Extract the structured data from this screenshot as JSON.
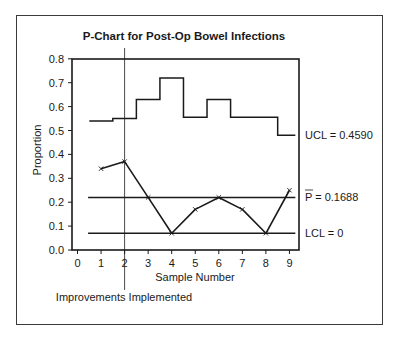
{
  "chart_data": {
    "type": "line",
    "title": "P-Chart for Post-Op Bowel Infections",
    "xlabel": "Sample Number",
    "ylabel": "Proportion",
    "xlim": [
      0,
      9.5
    ],
    "ylim": [
      0.0,
      0.8
    ],
    "x_ticks": [
      "0",
      "1",
      "2",
      "3",
      "4",
      "5",
      "6",
      "7",
      "8",
      "9"
    ],
    "y_ticks": [
      "0.0",
      "0.1",
      "0.2",
      "0.3",
      "0.4",
      "0.5",
      "0.6",
      "0.7",
      "0.8"
    ],
    "grid": false,
    "series": [
      {
        "name": "Proportion",
        "style": "line-with-x-markers",
        "x": [
          1,
          2,
          3,
          4,
          5,
          6,
          7,
          8,
          9
        ],
        "values": [
          0.34,
          0.37,
          0.22,
          0.07,
          0.17,
          0.22,
          0.17,
          0.07,
          0.25
        ]
      },
      {
        "name": "UCL",
        "style": "step",
        "x_edges": [
          0.5,
          1.5,
          2.5,
          3.5,
          4.5,
          5.5,
          6.5,
          7.5,
          8.5,
          9.25
        ],
        "values": [
          0.54,
          0.55,
          0.63,
          0.72,
          0.555,
          0.63,
          0.555,
          0.555,
          0.48
        ]
      }
    ],
    "reference_lines": [
      {
        "name": "P-bar",
        "y": 0.22,
        "label": "P̅ = 0.1688"
      },
      {
        "name": "LCL",
        "y": 0.07,
        "label": "LCL = 0"
      }
    ],
    "ucl_label": "UCL = 0.4590",
    "annotations": [
      {
        "type": "vertical-line",
        "x": 2,
        "label": "Improvements Implemented"
      }
    ]
  },
  "labels": {
    "title": "P-Chart for Post-Op Bowel Infections",
    "xlabel": "Sample Number",
    "ylabel": "Proportion",
    "ucl": "UCL = 0.4590",
    "pbar_symbol": "P",
    "pbar_value": " = 0.1688",
    "lcl": "LCL = 0",
    "annotation": "Improvements Implemented"
  }
}
